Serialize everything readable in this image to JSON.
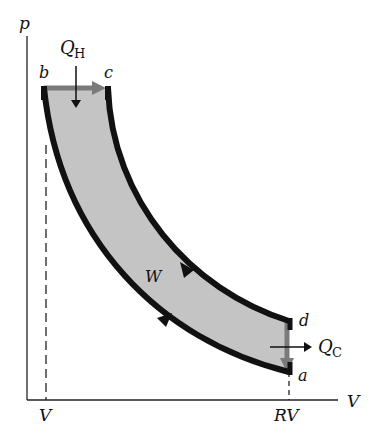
{
  "diagram": {
    "type": "pV diagram (heat engine cycle)",
    "axes": {
      "y_label": "p",
      "x_label": "V",
      "x_ticks": [
        "V",
        "RV"
      ]
    },
    "points": {
      "a": "a",
      "b": "b",
      "c": "c",
      "d": "d"
    },
    "heat_in": {
      "symbol": "Q",
      "subscript": "H"
    },
    "heat_out": {
      "symbol": "Q",
      "subscript": "C"
    },
    "work_label": "W",
    "colors": {
      "curve": "#111111",
      "fill": "#c4c4c4",
      "isochoric_arrow": "#7a7a7a",
      "axis": "#222222"
    }
  }
}
